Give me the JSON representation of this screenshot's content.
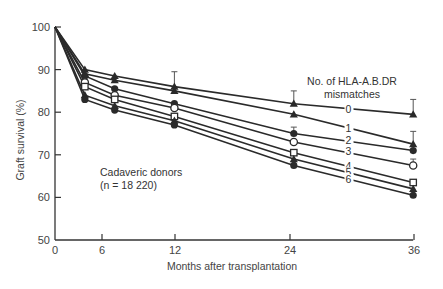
{
  "chart_data": {
    "type": "line",
    "title": "",
    "xlabel": "Months after transplantation",
    "ylabel": "Graft survival (%)",
    "xlim": [
      0,
      36
    ],
    "ylim": [
      50,
      100
    ],
    "x_ticks": [
      0,
      6,
      12,
      24,
      36
    ],
    "y_ticks": [
      50,
      60,
      70,
      80,
      90,
      100
    ],
    "grid": false,
    "x": [
      0,
      3,
      6,
      12,
      24,
      36
    ],
    "legend_title": "No. of HLA-A.B.DR mismatches",
    "legend_title_line1": "No. of HLA-A.B.DR",
    "legend_title_line2": "mismatches",
    "annotation_line1": "Cadaveric donors",
    "annotation_line2": "(n = 18 220)",
    "series": [
      {
        "name": "0",
        "marker": "triangle-filled",
        "values": [
          100,
          90,
          88.5,
          86,
          82,
          79.5
        ],
        "error_bars": [
          null,
          null,
          null,
          3.5,
          3,
          3.5
        ]
      },
      {
        "name": "1",
        "marker": "triangle-filled",
        "values": [
          100,
          89,
          87.5,
          85,
          79.5,
          72.5
        ],
        "error_bars": [
          null,
          null,
          null,
          null,
          null,
          3
        ]
      },
      {
        "name": "2",
        "marker": "circle-filled",
        "values": [
          100,
          88.5,
          85.5,
          82,
          75,
          71
        ],
        "error_bars": [
          null,
          null,
          null,
          null,
          1.5,
          null
        ]
      },
      {
        "name": "3",
        "marker": "circle-open",
        "values": [
          100,
          87,
          84,
          81,
          73,
          67.5
        ],
        "error_bars": [
          null,
          null,
          null,
          null,
          null,
          1.5
        ]
      },
      {
        "name": "4",
        "marker": "square-open",
        "values": [
          100,
          86,
          83,
          79,
          70.5,
          63.5
        ],
        "error_bars": [
          null,
          null,
          null,
          null,
          null,
          null
        ]
      },
      {
        "name": "5",
        "marker": "triangle-filled",
        "values": [
          100,
          84,
          81.5,
          78,
          69,
          62
        ],
        "error_bars": [
          null,
          null,
          null,
          null,
          null,
          null
        ]
      },
      {
        "name": "6",
        "marker": "circle-filled",
        "values": [
          100,
          83,
          80.5,
          77,
          67.5,
          60.5
        ],
        "error_bars": [
          null,
          null,
          null,
          null,
          null,
          null
        ]
      }
    ],
    "series_label_positions": [
      {
        "name": "0",
        "x_month": 29.5,
        "value": 80.8
      },
      {
        "name": "1",
        "x_month": 29.5,
        "value": 76.3
      },
      {
        "name": "2",
        "x_month": 29.5,
        "value": 73.5
      },
      {
        "name": "3",
        "x_month": 29.5,
        "value": 71.0
      },
      {
        "name": "4",
        "x_month": 29.5,
        "value": 67.4
      },
      {
        "name": "5",
        "x_month": 29.5,
        "value": 65.9
      },
      {
        "name": "6",
        "x_month": 29.5,
        "value": 64.3
      }
    ],
    "colors": {
      "line": "#2a2a2a",
      "axis": "#333333",
      "text": "#444444"
    }
  }
}
